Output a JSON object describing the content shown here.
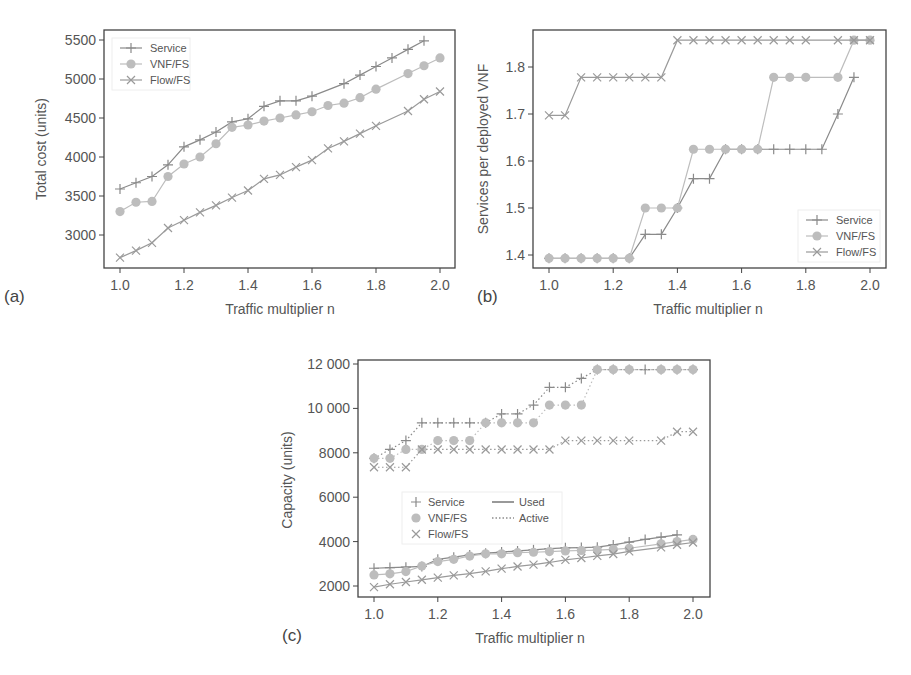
{
  "figure": {
    "panels": [
      {
        "id": "a",
        "label": "(a)"
      },
      {
        "id": "b",
        "label": "(b)"
      },
      {
        "id": "c",
        "label": "(c)"
      }
    ]
  },
  "colors": {
    "service": "#8a8a8a",
    "vnf_fs": "#bdbdbd",
    "flow_fs": "#9a9a9a",
    "frame": "#444444"
  },
  "chart_data": [
    {
      "panel": "(a)",
      "type": "line",
      "title": "",
      "xlabel": "Traffic multiplier n",
      "ylabel": "Total cost (units)",
      "xlim": [
        0.95,
        2.05
      ],
      "ylim": [
        2550,
        5600
      ],
      "xticks": [
        "1.0",
        "1.2",
        "1.4",
        "1.6",
        "1.8",
        "2.0"
      ],
      "yticks": [
        "3000",
        "3500",
        "4000",
        "4500",
        "5000",
        "5500"
      ],
      "grid": false,
      "legend_position": "upper left",
      "series": [
        {
          "name": "Service",
          "marker": "plus",
          "x": [
            1.0,
            1.05,
            1.1,
            1.15,
            1.2,
            1.25,
            1.3,
            1.35,
            1.4,
            1.45,
            1.5,
            1.55,
            1.6,
            1.7,
            1.75,
            1.8,
            1.85,
            1.9,
            1.95
          ],
          "values": [
            3590,
            3670,
            3750,
            3900,
            4130,
            4220,
            4320,
            4450,
            4490,
            4650,
            4720,
            4720,
            4780,
            4940,
            5050,
            5160,
            5270,
            5380,
            5490
          ]
        },
        {
          "name": "VNF/FS",
          "marker": "circle",
          "x": [
            1.0,
            1.05,
            1.1,
            1.15,
            1.2,
            1.25,
            1.3,
            1.35,
            1.4,
            1.45,
            1.5,
            1.55,
            1.6,
            1.65,
            1.7,
            1.75,
            1.8,
            1.9,
            1.95,
            2.0
          ],
          "values": [
            3300,
            3420,
            3430,
            3750,
            3910,
            4000,
            4170,
            4380,
            4410,
            4460,
            4500,
            4540,
            4580,
            4660,
            4690,
            4760,
            4870,
            5070,
            5170,
            5270
          ]
        },
        {
          "name": "Flow/FS",
          "marker": "x",
          "x": [
            1.0,
            1.05,
            1.1,
            1.15,
            1.2,
            1.25,
            1.3,
            1.35,
            1.4,
            1.45,
            1.5,
            1.55,
            1.6,
            1.65,
            1.7,
            1.75,
            1.8,
            1.9,
            1.95,
            2.0
          ],
          "values": [
            2710,
            2800,
            2900,
            3090,
            3190,
            3290,
            3380,
            3480,
            3570,
            3720,
            3770,
            3870,
            3960,
            4110,
            4200,
            4300,
            4400,
            4590,
            4740,
            4840
          ]
        }
      ]
    },
    {
      "panel": "(b)",
      "type": "line",
      "title": "",
      "xlabel": "Traffic multiplier n",
      "ylabel": "Services per deployed VNF",
      "xlim": [
        0.95,
        2.05
      ],
      "ylim": [
        1.37,
        1.885
      ],
      "xticks": [
        "1.0",
        "1.2",
        "1.4",
        "1.6",
        "1.8",
        "2.0"
      ],
      "yticks": [
        "1.4",
        "1.5",
        "1.6",
        "1.7",
        "1.8"
      ],
      "grid": false,
      "legend_position": "lower right",
      "series": [
        {
          "name": "Service",
          "marker": "plus",
          "x": [
            1.0,
            1.05,
            1.1,
            1.15,
            1.2,
            1.25,
            1.3,
            1.35,
            1.4,
            1.45,
            1.5,
            1.55,
            1.6,
            1.65,
            1.7,
            1.75,
            1.8,
            1.85,
            1.9,
            1.95
          ],
          "values": [
            1.393,
            1.393,
            1.393,
            1.393,
            1.393,
            1.393,
            1.444,
            1.444,
            1.5,
            1.5625,
            1.5625,
            1.625,
            1.625,
            1.625,
            1.625,
            1.625,
            1.625,
            1.625,
            1.7,
            1.778
          ]
        },
        {
          "name": "VNF/FS",
          "marker": "circle",
          "x": [
            1.0,
            1.05,
            1.1,
            1.15,
            1.2,
            1.25,
            1.3,
            1.35,
            1.4,
            1.45,
            1.5,
            1.55,
            1.6,
            1.65,
            1.7,
            1.75,
            1.8,
            1.9,
            1.95,
            2.0
          ],
          "values": [
            1.393,
            1.393,
            1.393,
            1.393,
            1.393,
            1.393,
            1.5,
            1.5,
            1.5,
            1.625,
            1.625,
            1.625,
            1.625,
            1.625,
            1.778,
            1.778,
            1.778,
            1.778,
            1.857,
            1.857
          ]
        },
        {
          "name": "Flow/FS",
          "marker": "x",
          "x": [
            1.0,
            1.05,
            1.1,
            1.15,
            1.2,
            1.25,
            1.3,
            1.35,
            1.4,
            1.45,
            1.5,
            1.55,
            1.6,
            1.65,
            1.7,
            1.75,
            1.8,
            1.9,
            1.95,
            2.0
          ],
          "values": [
            1.697,
            1.697,
            1.778,
            1.778,
            1.778,
            1.778,
            1.778,
            1.778,
            1.857,
            1.857,
            1.857,
            1.857,
            1.857,
            1.857,
            1.857,
            1.857,
            1.857,
            1.857,
            1.857,
            1.857
          ]
        }
      ]
    },
    {
      "panel": "(c)",
      "type": "line",
      "title": "",
      "xlabel": "Traffic multiplier n",
      "ylabel": "Capacity (units)",
      "xlim": [
        0.95,
        2.05
      ],
      "ylim": [
        1500,
        12200
      ],
      "xticks": [
        "1.0",
        "1.2",
        "1.4",
        "1.6",
        "1.8",
        "2.0"
      ],
      "yticks": [
        "2000",
        "4000",
        "6000",
        "8000",
        "10 000",
        "12 000"
      ],
      "grid": false,
      "legend_position": "center left",
      "legend_styles": [
        {
          "name": "Used",
          "linestyle": "solid"
        },
        {
          "name": "Active",
          "linestyle": "dotted"
        }
      ],
      "series": [
        {
          "name": "Service",
          "kind": "Active",
          "marker": "plus",
          "x": [
            1.0,
            1.05,
            1.1,
            1.15,
            1.2,
            1.25,
            1.3,
            1.35,
            1.4,
            1.45,
            1.5,
            1.55,
            1.6,
            1.65,
            1.7,
            1.75,
            1.8,
            1.85,
            1.9,
            1.95,
            2.0
          ],
          "values": [
            7750,
            8150,
            8550,
            9350,
            9350,
            9350,
            9350,
            9350,
            9750,
            9750,
            10150,
            10950,
            10950,
            11350,
            11750,
            11750,
            11750,
            11750,
            11750,
            11750,
            11750
          ]
        },
        {
          "name": "VNF/FS",
          "kind": "Active",
          "marker": "circle",
          "x": [
            1.0,
            1.05,
            1.1,
            1.15,
            1.2,
            1.25,
            1.3,
            1.35,
            1.4,
            1.45,
            1.5,
            1.55,
            1.6,
            1.65,
            1.7,
            1.75,
            1.8,
            1.9,
            1.95,
            2.0
          ],
          "values": [
            7750,
            7750,
            8150,
            8150,
            8550,
            8550,
            8550,
            9350,
            9350,
            9350,
            9350,
            10150,
            10150,
            10150,
            11750,
            11750,
            11750,
            11750,
            11750,
            11750
          ]
        },
        {
          "name": "Flow/FS",
          "kind": "Active",
          "marker": "x",
          "x": [
            1.0,
            1.05,
            1.1,
            1.15,
            1.2,
            1.25,
            1.3,
            1.35,
            1.4,
            1.45,
            1.5,
            1.55,
            1.6,
            1.65,
            1.7,
            1.75,
            1.8,
            1.9,
            1.95,
            2.0
          ],
          "values": [
            7350,
            7350,
            7350,
            8150,
            8150,
            8150,
            8150,
            8150,
            8150,
            8150,
            8150,
            8150,
            8550,
            8550,
            8550,
            8550,
            8550,
            8550,
            8950,
            8950
          ]
        },
        {
          "name": "Service",
          "kind": "Used",
          "marker": "plus",
          "x": [
            1.0,
            1.05,
            1.1,
            1.15,
            1.2,
            1.25,
            1.3,
            1.35,
            1.4,
            1.45,
            1.5,
            1.55,
            1.6,
            1.65,
            1.7,
            1.75,
            1.8,
            1.85,
            1.9,
            1.95
          ],
          "values": [
            2800,
            2830,
            2850,
            2880,
            3200,
            3300,
            3400,
            3480,
            3530,
            3580,
            3630,
            3680,
            3720,
            3730,
            3750,
            3850,
            3980,
            4100,
            4200,
            4300
          ]
        },
        {
          "name": "VNF/FS",
          "kind": "Used",
          "marker": "circle",
          "x": [
            1.0,
            1.05,
            1.1,
            1.15,
            1.2,
            1.25,
            1.3,
            1.35,
            1.4,
            1.45,
            1.5,
            1.55,
            1.6,
            1.65,
            1.7,
            1.75,
            1.8,
            1.9,
            1.95,
            2.0
          ],
          "values": [
            2500,
            2550,
            2650,
            2900,
            3100,
            3200,
            3350,
            3450,
            3450,
            3500,
            3520,
            3550,
            3580,
            3600,
            3620,
            3650,
            3700,
            3900,
            4000,
            4100
          ]
        },
        {
          "name": "Flow/FS",
          "kind": "Used",
          "marker": "x",
          "x": [
            1.0,
            1.05,
            1.1,
            1.15,
            1.2,
            1.25,
            1.3,
            1.35,
            1.4,
            1.45,
            1.5,
            1.55,
            1.6,
            1.65,
            1.7,
            1.75,
            1.8,
            1.9,
            1.95,
            2.0
          ],
          "values": [
            1950,
            2080,
            2180,
            2280,
            2380,
            2480,
            2560,
            2660,
            2780,
            2880,
            2960,
            3060,
            3180,
            3260,
            3360,
            3440,
            3560,
            3740,
            3860,
            3960
          ]
        }
      ]
    }
  ]
}
